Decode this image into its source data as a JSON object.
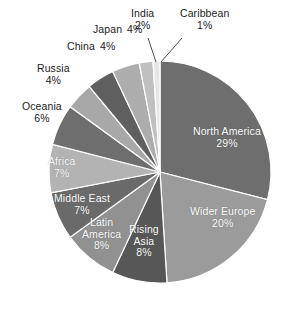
{
  "chart_data": {
    "type": "pie",
    "title": "",
    "subtitle": "",
    "xlabel": "",
    "ylabel": "",
    "legend_position": "none",
    "grid": false,
    "unit": "%",
    "start_angle_deg": 0,
    "direction": "clockwise",
    "categories": [
      "North America",
      "Wider Europe",
      "Rising Asia",
      "Latin America",
      "Middle East",
      "Africa",
      "Oceania",
      "Russia",
      "China",
      "Japan",
      "India",
      "Caribbean"
    ],
    "values": [
      29,
      20,
      8,
      8,
      7,
      7,
      6,
      4,
      4,
      4,
      2,
      1
    ],
    "slices": [
      {
        "name": "North America",
        "label": "North America",
        "value": 29,
        "pct_text": "29%",
        "color": "#6e6e6e",
        "label_placement": "inside",
        "label_color": "#ffffff",
        "label_x": 193,
        "label_y": 126,
        "leader": false
      },
      {
        "name": "Wider Europe",
        "label": "Wider Europe",
        "value": 20,
        "pct_text": "20%",
        "color": "#9b9b9b",
        "label_placement": "inside",
        "label_color": "#ffffff",
        "label_x": 190,
        "label_y": 206,
        "leader": false
      },
      {
        "name": "Rising Asia",
        "label": "Rising Asia",
        "value": 8,
        "pct_text": "8%",
        "color": "#575757",
        "label_placement": "inside",
        "label_color": "#ffffff",
        "label_x": 129,
        "label_y": 224,
        "leader": false
      },
      {
        "name": "Latin America",
        "label": "Latin America",
        "value": 8,
        "pct_text": "8%",
        "color": "#919191",
        "label_placement": "inside",
        "label_color": "#ffffff",
        "label_x": 82,
        "label_y": 217,
        "leader": false
      },
      {
        "name": "Middle East",
        "label": "Middle East",
        "value": 7,
        "pct_text": "7%",
        "color": "#6a6a6a",
        "label_placement": "inside",
        "label_color": "#ffffff",
        "label_x": 54,
        "label_y": 193,
        "leader": false
      },
      {
        "name": "Africa",
        "label": "Africa",
        "value": 7,
        "pct_text": "7%",
        "color": "#b3b3b3",
        "label_placement": "inside",
        "label_color": "#ffffff",
        "label_x": 48,
        "label_y": 156,
        "leader": false
      },
      {
        "name": "Oceania",
        "label": "Oceania",
        "value": 6,
        "pct_text": "6%",
        "color": "#6e6e6e",
        "label_placement": "outside",
        "label_color": "#1c1c1c",
        "label_x": 22,
        "label_y": 101,
        "leader": false
      },
      {
        "name": "Russia",
        "label": "Russia",
        "value": 4,
        "pct_text": "4%",
        "color": "#a8a8a8",
        "label_placement": "outside",
        "label_color": "#1c1c1c",
        "label_x": 37,
        "label_y": 63,
        "leader": false
      },
      {
        "name": "China",
        "label": "China",
        "value": 4,
        "pct_text": "4%",
        "color": "#5f5f5f",
        "label_placement": "outside",
        "label_color": "#1c1c1c",
        "label_x": 67,
        "label_y": 41,
        "leader": false
      },
      {
        "name": "Japan",
        "label": "Japan",
        "value": 4,
        "pct_text": "4%",
        "color": "#adadad",
        "label_placement": "outside",
        "label_color": "#1c1c1c",
        "label_x": 93,
        "label_y": 24,
        "leader": false
      },
      {
        "name": "India",
        "label": "India",
        "value": 2,
        "pct_text": "2%",
        "color": "#c0c0c0",
        "label_placement": "outside",
        "label_color": "#1c1c1c",
        "label_x": 131,
        "label_y": 8,
        "leader": true
      },
      {
        "name": "Caribbean",
        "label": "Caribbean",
        "value": 1,
        "pct_text": "1%",
        "color": "#e6e6e6",
        "label_placement": "outside",
        "label_color": "#1c1c1c",
        "label_x": 180,
        "label_y": 8,
        "leader": true
      }
    ],
    "geometry": {
      "cx": 160,
      "cy": 172,
      "r": 111
    },
    "leader_lines": [
      {
        "name": "india-leader",
        "x1": 148,
        "y1": 38,
        "x2": 156,
        "y2": 62
      },
      {
        "name": "caribbean-leader",
        "x1": 182,
        "y1": 38,
        "x2": 161,
        "y2": 62
      }
    ]
  }
}
